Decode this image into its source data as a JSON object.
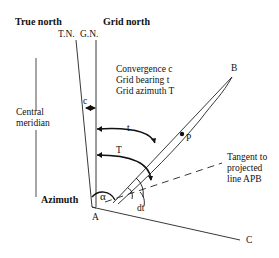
{
  "headers": {
    "true_north": "True north",
    "grid_north": "Grid north"
  },
  "line_labels": {
    "tn": "T.N.",
    "gn": "G.N."
  },
  "left_labels": {
    "central_meridian_1": "Central",
    "central_meridian_2": "meridian",
    "azimuth": "Azimuth"
  },
  "legend": {
    "line1": "Convergence c",
    "line2": "Grid bearing t",
    "line3": "Grid azimuth T"
  },
  "points": {
    "a": "A",
    "b": "B",
    "c": "C",
    "p": "P"
  },
  "angles": {
    "c": "c",
    "t": "t",
    "T": "T",
    "alpha": "α",
    "dt": "dt"
  },
  "tangent": {
    "line1": "Tangent to",
    "line2": "projected",
    "line3": "line APB"
  }
}
